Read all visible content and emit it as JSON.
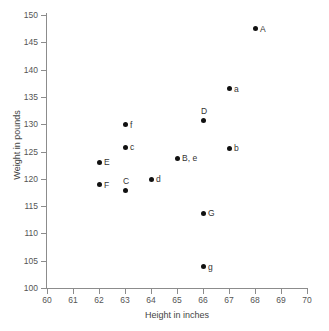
{
  "chart_data": {
    "type": "scatter",
    "title": "",
    "xlabel": "Height in inches",
    "ylabel": "Weight in pounds",
    "xlim": [
      60,
      70
    ],
    "ylim": [
      100,
      150
    ],
    "xticks": [
      60,
      61,
      62,
      63,
      64,
      65,
      66,
      67,
      68,
      69,
      70
    ],
    "yticks": [
      100,
      105,
      110,
      115,
      120,
      125,
      130,
      135,
      140,
      145,
      150
    ],
    "grid": false,
    "legend": "none",
    "marker_color": "#111111",
    "axis_color": "#8c8c8c",
    "points": [
      {
        "label": "A",
        "x": 68,
        "y": 147.5,
        "label_pos": "right"
      },
      {
        "label": "a",
        "x": 67,
        "y": 136.5,
        "label_pos": "right"
      },
      {
        "label": "D",
        "x": 66,
        "y": 130.6,
        "label_pos": "above"
      },
      {
        "label": "f",
        "x": 63,
        "y": 129.9,
        "label_pos": "right"
      },
      {
        "label": "c",
        "x": 63,
        "y": 125.8,
        "label_pos": "right"
      },
      {
        "label": "b",
        "x": 67,
        "y": 125.6,
        "label_pos": "right"
      },
      {
        "label": "B, e",
        "x": 65,
        "y": 123.8,
        "label_pos": "right"
      },
      {
        "label": "E",
        "x": 62,
        "y": 123.0,
        "label_pos": "right"
      },
      {
        "label": "d",
        "x": 64,
        "y": 119.9,
        "label_pos": "right"
      },
      {
        "label": "F",
        "x": 62,
        "y": 118.9,
        "label_pos": "right"
      },
      {
        "label": "C",
        "x": 63,
        "y": 117.8,
        "label_pos": "above"
      },
      {
        "label": "G",
        "x": 66,
        "y": 113.7,
        "label_pos": "right"
      },
      {
        "label": "g",
        "x": 66,
        "y": 103.9,
        "label_pos": "right"
      }
    ]
  }
}
